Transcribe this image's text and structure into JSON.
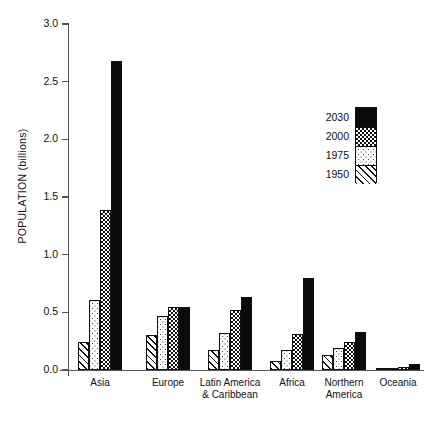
{
  "chart_data": {
    "type": "bar",
    "title": "",
    "xlabel": "",
    "ylabel": "POPULATION (billions)",
    "ylim": [
      0.0,
      3.0
    ],
    "ytick_labels": [
      "0.0",
      "0.5",
      "1.0",
      "1.5",
      "2.0",
      "2.5",
      "3.0"
    ],
    "ytick_values": [
      0.0,
      0.5,
      1.0,
      1.5,
      2.0,
      2.5,
      3.0
    ],
    "grid": false,
    "legend_position": "upper right",
    "categories": [
      "Asia",
      "Europe",
      "Latin America\n& Caribbean",
      "Africa",
      "Northern\nAmerica",
      "Oceania"
    ],
    "category_lines": [
      [
        "Asia"
      ],
      [
        "Europe"
      ],
      [
        "Latin America",
        "& Caribbean"
      ],
      [
        "Africa"
      ],
      [
        "Northern",
        "America"
      ],
      [
        "Oceania"
      ]
    ],
    "series": [
      {
        "name": "1950",
        "pattern": "diagonal-hatch",
        "values": [
          0.24,
          0.3,
          0.17,
          0.08,
          0.13,
          0.01
        ]
      },
      {
        "name": "1975",
        "pattern": "light-dots",
        "values": [
          0.61,
          0.47,
          0.32,
          0.17,
          0.19,
          0.02
        ]
      },
      {
        "name": "2000",
        "pattern": "checkerboard",
        "values": [
          1.39,
          0.55,
          0.52,
          0.31,
          0.24,
          0.03
        ]
      },
      {
        "name": "2030",
        "pattern": "solid-black",
        "values": [
          2.68,
          0.55,
          0.63,
          0.8,
          0.33,
          0.05
        ]
      }
    ],
    "series_draw_order": [
      "1950",
      "1975",
      "2000",
      "2030"
    ],
    "legend_entries": [
      {
        "label": "2030",
        "pattern": "solid-black"
      },
      {
        "label": "2000",
        "pattern": "checkerboard"
      },
      {
        "label": "1975",
        "pattern": "light-dots"
      },
      {
        "label": "1950",
        "pattern": "diagonal-hatch"
      }
    ],
    "colors": {
      "bar_outline": "#111111",
      "solid_fill": "#0a0a0a",
      "axis": "#555555",
      "background": "#ffffff",
      "text": "#111111"
    }
  },
  "layout": {
    "plot_left": 68,
    "plot_right": 424,
    "plot_top": 24,
    "plot_bottom": 370,
    "bar_width": 11,
    "group_starts": [
      78,
      146,
      208,
      270,
      322,
      376
    ]
  }
}
